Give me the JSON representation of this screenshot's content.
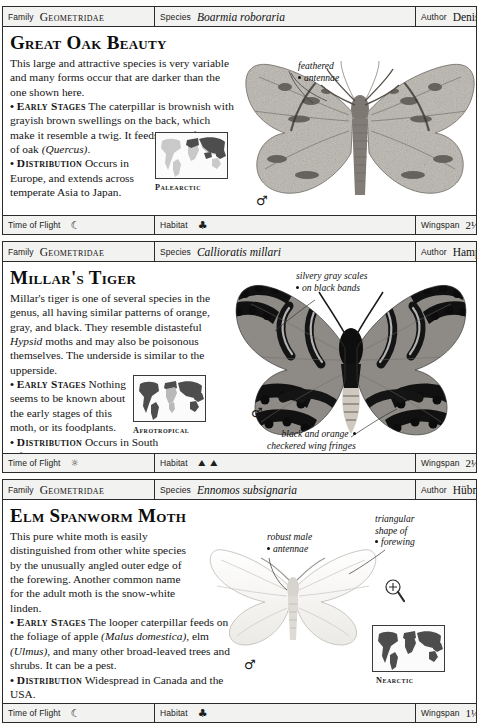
{
  "page": {
    "document_type": "field-guide-species-pages"
  },
  "species": [
    {
      "id": "great-oak-beauty",
      "header": {
        "family_label": "Family",
        "family_value": "Geometridae",
        "species_label": "Species",
        "species_value": "Boarmia roboraria",
        "author_label": "Author",
        "author_value": "Denis & Schiffermüller"
      },
      "title": "Great Oak Beauty",
      "paragraphs": [
        "This large and attractive species is very variable and many forms occur that are darker than the one shown here.",
        "• EARLY STAGES The caterpillar is brownish with grayish brown swellings on the back, which make it resemble a twig. It feeds on the foliage of oak (Quercus).",
        "• DISTRIBUTION Occurs in Europe, and extends across temperate Asia to Japan."
      ],
      "map_label": "Palearctic",
      "callouts": [
        {
          "id": "feathered-antennae",
          "text_line1": "feathered",
          "text_line2": "antennae"
        }
      ],
      "sex_symbol": "♂",
      "footer": {
        "flight_label": "Time of Flight",
        "flight_icons": [
          "moon"
        ],
        "habitat_label": "Habitat",
        "habitat_icons": [
          "broadleaf-tree"
        ],
        "wingspan_label": "Wingspan",
        "wingspan_value": "2½–2¾ in (6–7 cm)"
      }
    },
    {
      "id": "millars-tiger",
      "header": {
        "family_label": "Family",
        "family_value": "Geometridae",
        "species_label": "Species",
        "species_value": "Callioratis millari",
        "author_label": "Author",
        "author_value": "Hampson"
      },
      "title": "Millar's Tiger",
      "paragraphs": [
        "Millar's tiger is one of several species in the genus, all having similar patterns of orange, gray, and black. They resemble distasteful Hypsid moths and may also be poisonous themselves. The underside is similar to the upperside.",
        "• EARLY STAGES Nothing seems to be known about the early stages of this moth, or its foodplants.",
        "• DISTRIBUTION Occurs in South Africa."
      ],
      "map_label": "Afrotropical",
      "callouts": [
        {
          "id": "silvery-gray-scales",
          "text_line1": "silvery gray scales",
          "text_line2": "on black bands"
        },
        {
          "id": "checkered-wing-fringes",
          "text_line1": "black and orange",
          "text_line2": "checkered wing fringes"
        }
      ],
      "sex_symbol": "♂",
      "footer": {
        "flight_label": "Time of Flight",
        "flight_icons": [
          "sun"
        ],
        "habitat_label": "Habitat",
        "habitat_icons": [
          "scrub",
          "scrub"
        ],
        "wingspan_label": "Wingspan",
        "wingspan_value": "2⅛–2⅜ in (5.5–6 cm)"
      }
    },
    {
      "id": "elm-spanworm-moth",
      "header": {
        "family_label": "Family",
        "family_value": "Geometridae",
        "species_label": "Species",
        "species_value": "Ennomos subsignaria",
        "author_label": "Author",
        "author_value": "Hübner"
      },
      "title": "Elm Spanworm Moth",
      "paragraphs": [
        "This pure white moth is easily distinguished from other white species by the unusually angled outer edge of the forewing. Another common name for the adult moth is the snow-white linden.",
        "• EARLY STAGES The looper caterpillar feeds on the foliage of apple (Malus domestica), elm (Ulmus), and many other broad-leaved trees and shrubs. It can be a pest.",
        "• DISTRIBUTION Widespread in Canada and the USA."
      ],
      "map_label": "Nearctic",
      "callouts": [
        {
          "id": "robust-male-antennae",
          "text_line1": "robust male",
          "text_line2": "antennae"
        },
        {
          "id": "triangular-forewing",
          "text_line1": "triangular",
          "text_line2": "shape of",
          "text_line3": "forewing"
        }
      ],
      "sex_symbol": "♂",
      "magnifier_icon": "magnifier-plus",
      "footer": {
        "flight_label": "Time of Flight",
        "flight_icons": [
          "moon"
        ],
        "habitat_label": "Habitat",
        "habitat_icons": [
          "broadleaf-tree"
        ],
        "wingspan_label": "Wingspan",
        "wingspan_value": "1¼–1½ in (3–4 cm)"
      }
    }
  ]
}
